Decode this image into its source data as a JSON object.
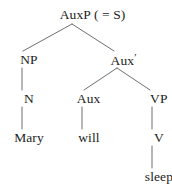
{
  "figure": {
    "kind": "syntax-tree",
    "sentence": "Mary will sleep",
    "colors": {
      "background": "#ffffff",
      "text": "#1c1c1c",
      "edge": "#6e6e6e"
    }
  },
  "nodes": {
    "root": {
      "label": "AuxP ( = S)",
      "x": 86,
      "y": 14
    },
    "np": {
      "label": "NP",
      "x": 22,
      "y": 59
    },
    "auxbar": {
      "label": "Aux",
      "prime": "′",
      "x": 117,
      "y": 59
    },
    "n": {
      "label": "N",
      "x": 22,
      "y": 98
    },
    "aux": {
      "label": "Aux",
      "x": 82,
      "y": 98
    },
    "vp": {
      "label": "VP",
      "x": 152,
      "y": 98
    },
    "mary": {
      "label": "Mary",
      "x": 22,
      "y": 137
    },
    "will": {
      "label": "will",
      "x": 82,
      "y": 137
    },
    "v": {
      "label": "V",
      "x": 152,
      "y": 137
    },
    "sleep": {
      "label": "sleep",
      "x": 152,
      "y": 176
    }
  },
  "edges": [
    {
      "name": "auxp-to-np",
      "from": "AuxP ( = S)",
      "to": "NP",
      "x1": 72,
      "y1": 24,
      "x2": 23,
      "y2": 51
    },
    {
      "name": "auxp-to-auxbar",
      "from": "AuxP ( = S)",
      "to": "Aux′",
      "x1": 72,
      "y1": 24,
      "x2": 114,
      "y2": 51
    },
    {
      "name": "np-to-n",
      "from": "NP",
      "to": "N",
      "x1": 22,
      "y1": 68,
      "x2": 22,
      "y2": 90
    },
    {
      "name": "auxbar-to-aux",
      "from": "Aux′",
      "to": "Aux",
      "x1": 117,
      "y1": 68,
      "x2": 84,
      "y2": 90
    },
    {
      "name": "auxbar-to-vp",
      "from": "Aux′",
      "to": "VP",
      "x1": 117,
      "y1": 68,
      "x2": 150,
      "y2": 90
    },
    {
      "name": "n-to-mary",
      "from": "N",
      "to": "Mary",
      "x1": 22,
      "y1": 107,
      "x2": 22,
      "y2": 129
    },
    {
      "name": "aux-to-will",
      "from": "Aux",
      "to": "will",
      "x1": 82,
      "y1": 107,
      "x2": 82,
      "y2": 129
    },
    {
      "name": "vp-to-v",
      "from": "VP",
      "to": "V",
      "x1": 152,
      "y1": 107,
      "x2": 152,
      "y2": 129
    },
    {
      "name": "v-to-sleep",
      "from": "V",
      "to": "sleep",
      "x1": 152,
      "y1": 146,
      "x2": 152,
      "y2": 168
    }
  ]
}
